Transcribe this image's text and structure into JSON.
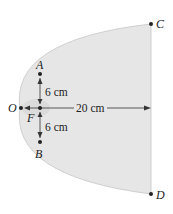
{
  "diagram": {
    "points": {
      "A": "A",
      "B": "B",
      "C": "C",
      "D": "D",
      "O": "O",
      "F": "F"
    },
    "dimensions": {
      "upper": "6 cm",
      "lower": "6 cm",
      "axis": "20 cm"
    },
    "colors": {
      "fill": "#e6e6e6",
      "stroke": "#c8c8c8",
      "line": "#333333"
    }
  }
}
